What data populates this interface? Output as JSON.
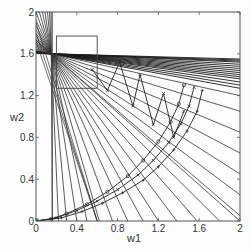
{
  "chart_data": {
    "type": "line",
    "title": "",
    "xlabel": "w1",
    "ylabel": "w2",
    "xlim": [
      0,
      2
    ],
    "ylim": [
      0,
      2
    ],
    "xticks": [
      "0",
      "0.4",
      "0.8",
      "1.2",
      "1.6",
      "2"
    ],
    "yticks": [
      "0",
      "0.4",
      "0.8",
      "1.2",
      "1.6",
      "2"
    ],
    "grid": false,
    "legend": null,
    "fan_center": [
      0.15,
      1.6
    ],
    "fan_lines_shallow_right_edge_y": [
      1.27,
      1.3,
      1.33,
      1.36,
      1.38,
      1.4,
      1.42,
      1.44,
      1.46,
      1.48,
      1.5,
      1.52,
      1.53,
      1.54,
      1.55
    ],
    "fan_lines_steep_bottom_x": [
      0.16,
      0.22,
      0.3,
      0.4,
      0.5,
      0.62,
      0.75,
      0.9,
      1.05,
      1.2,
      1.38,
      1.58,
      1.8,
      2.0
    ],
    "fan_lines_mid_right_edge_y": [
      0.05,
      0.25,
      0.45,
      0.65,
      0.85,
      1.05,
      1.2
    ],
    "vertical_line_x": 0.16,
    "rectangles": [
      {
        "x0": 0.2,
        "x1": 0.6,
        "y0": 1.27,
        "y1": 1.77
      }
    ],
    "series": [
      {
        "name": "trajectory-outer",
        "marker": "o",
        "points": [
          [
            0,
            0
          ],
          [
            0.15,
            0.02
          ],
          [
            0.3,
            0.07
          ],
          [
            0.5,
            0.16
          ],
          [
            0.7,
            0.28
          ],
          [
            0.9,
            0.43
          ],
          [
            1.05,
            0.58
          ],
          [
            1.2,
            0.76
          ],
          [
            1.32,
            0.95
          ],
          [
            1.4,
            1.12
          ],
          [
            1.45,
            1.3
          ]
        ]
      },
      {
        "name": "trajectory-middle",
        "marker": "x",
        "points": [
          [
            0,
            0
          ],
          [
            0.2,
            0.03
          ],
          [
            0.4,
            0.1
          ],
          [
            0.6,
            0.19
          ],
          [
            0.8,
            0.3
          ],
          [
            1.0,
            0.44
          ],
          [
            1.15,
            0.58
          ],
          [
            1.3,
            0.75
          ],
          [
            1.42,
            0.93
          ],
          [
            1.5,
            1.1
          ],
          [
            1.55,
            1.28
          ]
        ]
      },
      {
        "name": "trajectory-inner",
        "marker": "+",
        "points": [
          [
            0,
            0
          ],
          [
            0.25,
            0.03
          ],
          [
            0.45,
            0.09
          ],
          [
            0.65,
            0.17
          ],
          [
            0.85,
            0.27
          ],
          [
            1.05,
            0.39
          ],
          [
            1.2,
            0.52
          ],
          [
            1.35,
            0.68
          ],
          [
            1.48,
            0.86
          ],
          [
            1.58,
            1.05
          ],
          [
            1.63,
            1.25
          ]
        ]
      },
      {
        "name": "zigzag",
        "marker": "x",
        "points": [
          [
            0.55,
            1.45
          ],
          [
            0.7,
            1.25
          ],
          [
            0.82,
            1.52
          ],
          [
            0.95,
            1.1
          ],
          [
            1.02,
            1.4
          ],
          [
            1.15,
            0.92
          ],
          [
            1.25,
            1.22
          ],
          [
            1.35,
            0.8
          ],
          [
            1.45,
            1.05
          ]
        ]
      }
    ]
  }
}
